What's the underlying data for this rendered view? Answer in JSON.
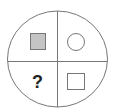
{
  "puzzle": {
    "quadrants": [
      {
        "position": "top-left",
        "shape": "square",
        "fill": "#c4c4c4"
      },
      {
        "position": "top-right",
        "shape": "circle",
        "fill": "#ffffff"
      },
      {
        "position": "bottom-left",
        "shape": "unknown",
        "label": "?"
      },
      {
        "position": "bottom-right",
        "shape": "square",
        "fill": "#ffffff"
      }
    ],
    "question_mark": "?",
    "line_color": "#777777"
  }
}
